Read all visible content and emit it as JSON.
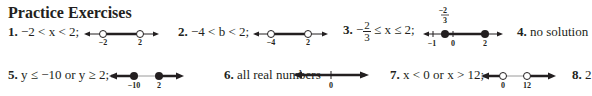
{
  "heading": "Practice Exercises",
  "exercises": [
    {
      "number": "1.",
      "text": "−2 < x < 2;",
      "line": {
        "left_label": "−2",
        "right_label": "2",
        "left_point": "open",
        "right_point": "open"
      }
    },
    {
      "number": "2.",
      "text": "−4 < b < 2;",
      "line": {
        "left_label": "−4",
        "right_label": "2",
        "left_point": "open",
        "right_point": "open"
      }
    },
    {
      "number": "3.",
      "text_prefix": "−",
      "frac_num": "2",
      "frac_den": "3",
      "text_suffix": "≤ x ≤ 2;",
      "line": {
        "top_label_num": "2",
        "top_label_den": "3",
        "top_label_sign": "−",
        "labels": [
          "−1",
          "0",
          "2"
        ],
        "left_point": "closed",
        "right_point": "closed"
      }
    },
    {
      "number": "4.",
      "text": "no solution"
    },
    {
      "number": "5.",
      "text": "y ≤ −10 or y ≥ 2;",
      "line": {
        "left_label": "−10",
        "right_label": "2",
        "left_point": "closed",
        "right_point": "closed"
      }
    },
    {
      "number": "6.",
      "text": "all real numbers",
      "line": {
        "center_label": "0"
      }
    },
    {
      "number": "7.",
      "text": "x < 0 or x > 12;",
      "line": {
        "left_label": "0",
        "right_label": "12",
        "left_point": "open",
        "right_point": "open"
      }
    },
    {
      "number": "8.",
      "text": "2"
    }
  ]
}
